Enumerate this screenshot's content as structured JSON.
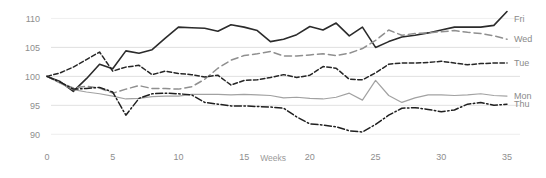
{
  "chart_data": {
    "type": "line",
    "title": "",
    "subtitle": "",
    "xlabel": "Weeks",
    "ylabel": "",
    "xlim": [
      0,
      35
    ],
    "ylim": [
      88.5,
      111.8
    ],
    "grid": true,
    "legend_position": "right-inline",
    "x_ticks": [
      "0",
      "5",
      "10",
      "15",
      "20",
      "25",
      "30",
      "35"
    ],
    "x_tick_values": [
      0,
      5,
      10,
      15,
      20,
      25,
      30,
      35
    ],
    "y_ticks": [
      "110",
      "105",
      "100",
      "95",
      "90"
    ],
    "y_tick_values": [
      110,
      105,
      100,
      95,
      90
    ],
    "x": [
      0,
      1,
      2,
      3,
      4,
      5,
      6,
      7,
      8,
      9,
      10,
      11,
      12,
      13,
      14,
      15,
      16,
      17,
      18,
      19,
      20,
      21,
      22,
      23,
      24,
      25,
      26,
      27,
      28,
      29,
      30,
      31,
      32,
      33,
      34,
      35
    ],
    "series": [
      {
        "name": "Fri",
        "label": "Fri",
        "color": "#2b2b2b",
        "style": "solid",
        "width": 1.6,
        "label_value": 109.9,
        "values": [
          100.0,
          99.1,
          97.4,
          99.6,
          102.1,
          101.3,
          104.4,
          104.0,
          104.6,
          106.6,
          108.5,
          108.4,
          108.3,
          107.8,
          108.9,
          108.5,
          107.9,
          106.0,
          106.4,
          107.2,
          108.6,
          108.0,
          109.2,
          107.0,
          108.5,
          105.0,
          106.0,
          106.8,
          107.1,
          107.5,
          108.0,
          108.5,
          108.5,
          108.5,
          108.8,
          111.2
        ]
      },
      {
        "name": "Wed",
        "label": "Wed",
        "color": "#8f8f8f",
        "style": "dashed",
        "width": 1.5,
        "label_value": 106.4,
        "values": [
          100.0,
          98.9,
          98.0,
          98.3,
          98.0,
          97.1,
          97.8,
          98.4,
          97.9,
          97.9,
          97.8,
          98.2,
          99.5,
          101.4,
          102.8,
          103.6,
          103.9,
          104.3,
          103.5,
          103.5,
          103.7,
          103.9,
          103.6,
          104.0,
          104.8,
          106.2,
          108.0,
          107.1,
          107.4,
          107.5,
          107.7,
          107.9,
          107.6,
          107.4,
          107.0,
          106.4
        ]
      },
      {
        "name": "Tue",
        "label": "Tue",
        "color": "#262626",
        "style": "dashed-fine",
        "width": 1.5,
        "label_value": 102.3,
        "values": [
          100.0,
          100.6,
          101.6,
          102.9,
          104.2,
          100.9,
          101.6,
          101.9,
          100.3,
          100.9,
          100.5,
          100.3,
          99.9,
          100.2,
          98.5,
          99.3,
          99.4,
          99.8,
          100.3,
          99.8,
          100.2,
          101.7,
          101.4,
          99.5,
          99.4,
          100.6,
          102.1,
          102.3,
          102.3,
          102.4,
          102.6,
          102.3,
          102.0,
          102.2,
          102.3,
          102.3
        ]
      },
      {
        "name": "Mon",
        "label": "Mon",
        "color": "#a2a2a2",
        "style": "solid",
        "width": 1.2,
        "label_value": 96.7,
        "values": [
          100.0,
          98.8,
          97.7,
          97.3,
          97.0,
          96.6,
          96.1,
          96.2,
          96.5,
          96.6,
          96.6,
          96.9,
          96.9,
          96.9,
          96.8,
          96.9,
          96.8,
          96.7,
          96.3,
          96.4,
          96.2,
          96.1,
          96.4,
          97.1,
          95.9,
          99.3,
          96.7,
          95.5,
          96.3,
          96.8,
          96.8,
          96.7,
          96.8,
          97.0,
          96.7,
          96.6
        ]
      },
      {
        "name": "Thu",
        "label": "Thu",
        "color": "#1f1f1f",
        "style": "dash-dot",
        "width": 1.5,
        "label_value": 95.2,
        "values": [
          100.0,
          99.0,
          97.8,
          97.9,
          98.1,
          97.3,
          93.3,
          96.2,
          97.0,
          97.1,
          97.0,
          96.8,
          95.5,
          95.2,
          94.9,
          94.9,
          94.8,
          94.7,
          94.5,
          93.0,
          91.8,
          91.6,
          91.3,
          90.6,
          90.4,
          91.7,
          93.3,
          94.5,
          94.6,
          94.3,
          93.9,
          94.2,
          95.2,
          95.5,
          95.0,
          95.2
        ]
      }
    ]
  },
  "axis": {
    "x_label": "Weeks"
  }
}
